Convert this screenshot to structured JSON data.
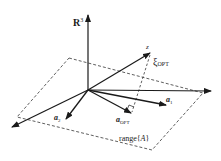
{
  "figure": {
    "space_label": "R",
    "space_superscript": "3",
    "vector_z_label": "z",
    "xi_symbol": "ξ",
    "xi_subscript": "OPT",
    "a1_symbol": "a",
    "a1_subscript": "1",
    "a2_symbol": "a",
    "a2_subscript": "2",
    "aopt_symbol": "a",
    "aopt_subscript": "OPT",
    "plane_label_prefix": "range{",
    "plane_label_var": "A",
    "plane_label_suffix": "}"
  },
  "colors": {
    "stroke": "#1a1a1a",
    "background": "#ffffff"
  }
}
